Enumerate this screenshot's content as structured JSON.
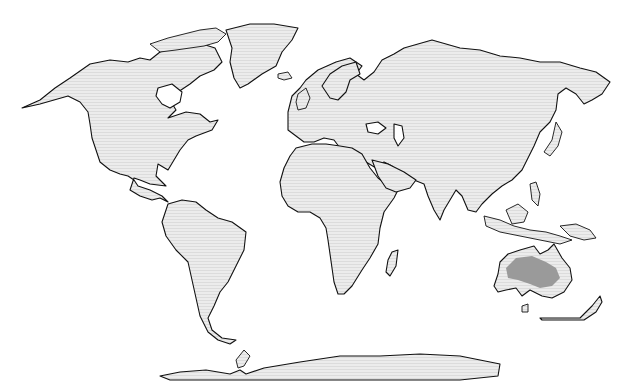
{
  "map": {
    "type": "world distribution map",
    "projection": "equirectangular-like world map",
    "colors": {
      "ocean": "#ffffff",
      "land": "#e6e6e6",
      "coastline": "#111111",
      "highlight": "#9a9a9a"
    },
    "regions": [
      {
        "name": "North America"
      },
      {
        "name": "Greenland"
      },
      {
        "name": "South America"
      },
      {
        "name": "Europe-Asia"
      },
      {
        "name": "Africa"
      },
      {
        "name": "Madagascar"
      },
      {
        "name": "Australia"
      },
      {
        "name": "New Zealand"
      },
      {
        "name": "Antarctica"
      }
    ],
    "highlighted_region": {
      "name": "Central Australia distribution area",
      "continent": "Australia"
    }
  }
}
